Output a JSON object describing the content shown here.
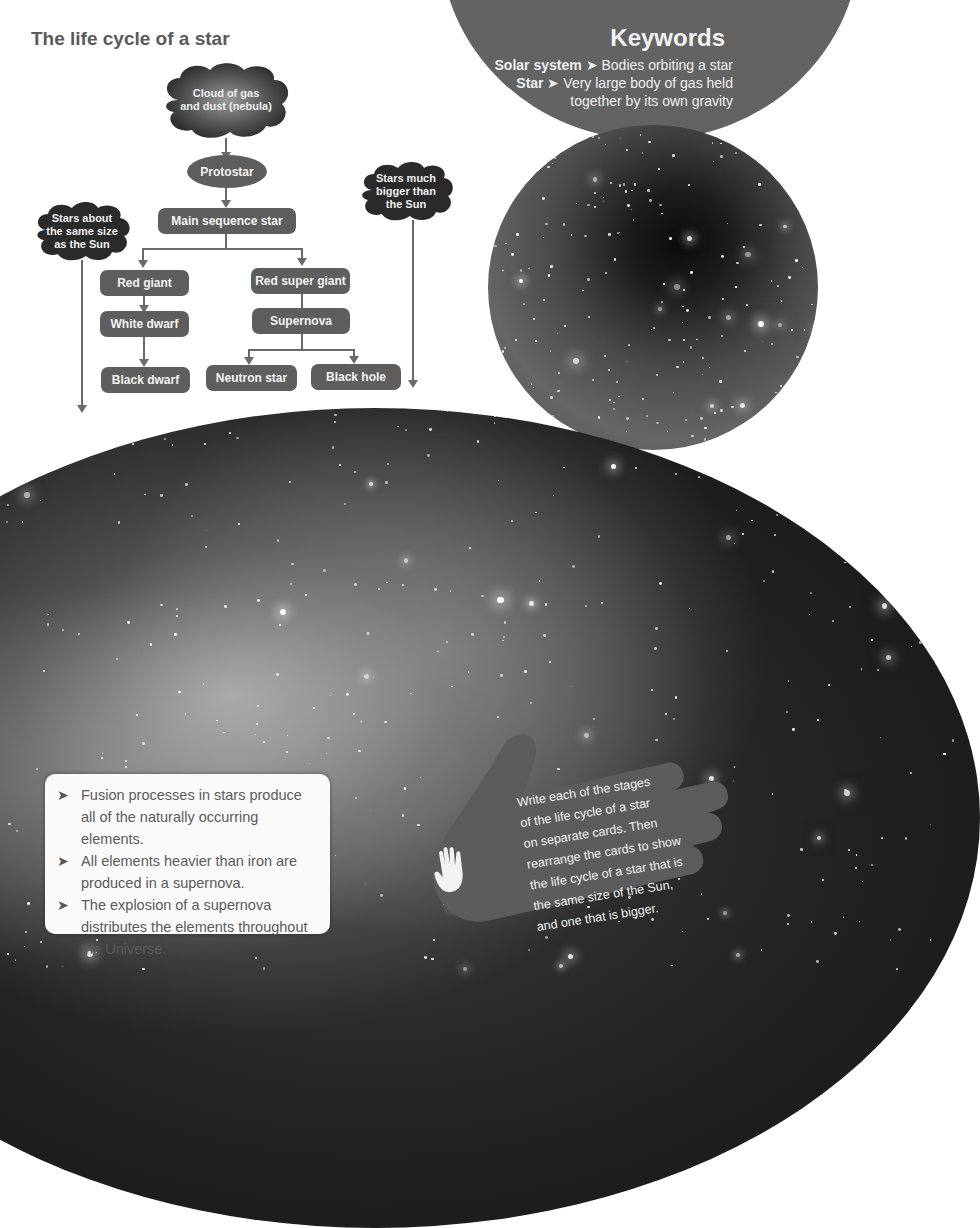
{
  "title": "The life cycle of a star",
  "keywords": {
    "heading": "Keywords",
    "items": [
      {
        "term": "Solar system",
        "separator": "➤",
        "definition": "Bodies orbiting a star"
      },
      {
        "term": "Star",
        "separator": "➤",
        "definition": "Very large body of gas held",
        "definition_cont": "together by its own gravity"
      }
    ]
  },
  "flowchart": {
    "start": {
      "line1": "Cloud of gas",
      "line2": "and dust (nebula)"
    },
    "protostar": "Protostar",
    "main_sequence": "Main sequence star",
    "branch_small": {
      "label_line1": "Stars about",
      "label_line2": "the same size",
      "label_line3": "as the Sun"
    },
    "branch_big": {
      "label_line1": "Stars much",
      "label_line2": "bigger than",
      "label_line3": "the Sun"
    },
    "red_giant": "Red giant",
    "white_dwarf": "White dwarf",
    "black_dwarf": "Black dwarf",
    "red_super_giant": "Red super giant",
    "supernova": "Supernova",
    "neutron_star": "Neutron star",
    "black_hole": "Black hole"
  },
  "info_box": {
    "bullet_icon": "➤",
    "items": [
      "Fusion processes in stars produce all of the naturally occurring elements.",
      "All elements heavier than iron are produced in a supernova.",
      "The explosion of a supernova distributes the elements throughout the Universe."
    ]
  },
  "activity": {
    "icon": "hand-icon",
    "text": "Write each of the stages\nof the life cycle of a star\non separate cards. Then\nrearrange the cards to show\nthe life cycle of a star that is\nthe same size of the Sun,\nand one that is bigger."
  },
  "colors": {
    "node_fill": "#5e5e5e",
    "keywords_circle": "#636363",
    "title_text": "#5a5a5a",
    "connector": "#6a6a6a"
  }
}
